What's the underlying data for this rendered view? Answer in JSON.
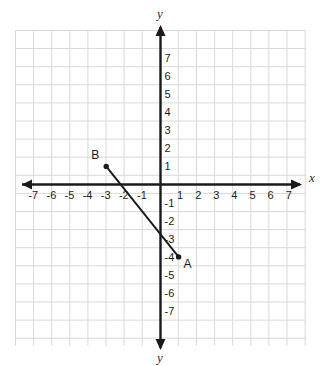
{
  "figure": {
    "type": "coordinate-plane",
    "background_color": "#ffffff",
    "grid_color": "#d9d9d9",
    "axis_color": "#1a1a1a",
    "segment_color": "#1a1a1a",
    "axis_labels": {
      "x_right": "x",
      "y_top": "y",
      "y_bottom": "y"
    }
  },
  "chart_data": {
    "type": "scatter",
    "title": "",
    "xlabel": "x",
    "ylabel": "y",
    "xlim": [
      -8,
      8
    ],
    "ylim": [
      -8,
      8
    ],
    "grid": true,
    "legend": "none",
    "x_ticks": [
      "-7",
      "-6",
      "-5",
      "-4",
      "-3",
      "-2",
      "-1",
      "1",
      "2",
      "3",
      "4",
      "5",
      "6",
      "7"
    ],
    "x_tick_values": [
      -7,
      -6,
      -5,
      -4,
      -3,
      -2,
      -1,
      1,
      2,
      3,
      4,
      5,
      6,
      7
    ],
    "y_ticks": [
      "7",
      "6",
      "5",
      "4",
      "3",
      "2",
      "1",
      "-1",
      "-2",
      "-3",
      "-4",
      "-5",
      "-6",
      "-7"
    ],
    "y_tick_values": [
      7,
      6,
      5,
      4,
      3,
      2,
      1,
      -1,
      -2,
      -3,
      -4,
      -5,
      -6,
      -7
    ],
    "points": [
      {
        "label": "B",
        "x": -3,
        "y": 1,
        "label_dx": -11,
        "label_dy": -7
      },
      {
        "label": "A",
        "x": 1,
        "y": -4,
        "label_dx": 9,
        "label_dy": 11
      }
    ],
    "segments": [
      {
        "from": "B",
        "to": "A",
        "x1": -3,
        "y1": 1,
        "x2": 1,
        "y2": -4
      }
    ],
    "annotations": []
  }
}
